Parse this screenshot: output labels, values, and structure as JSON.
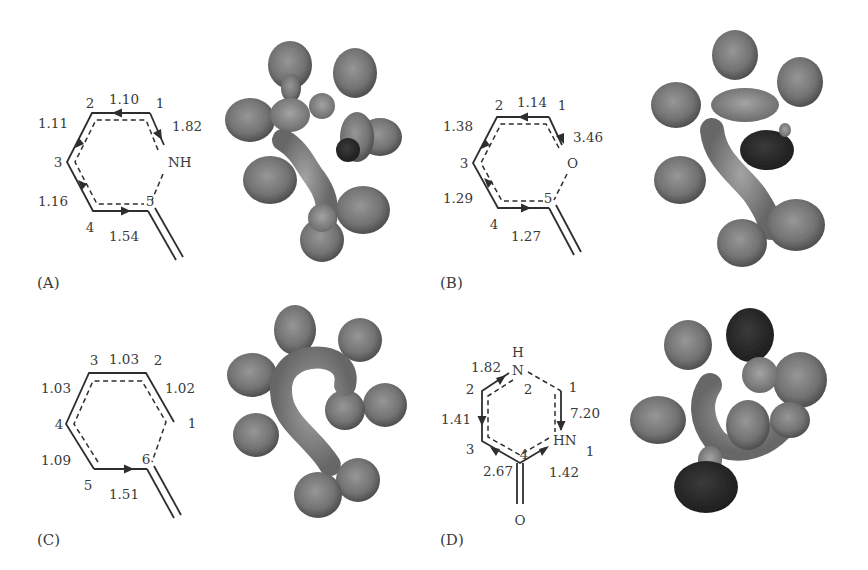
{
  "figure": {
    "panels": [
      {
        "id": "A",
        "label": "(A)",
        "heteroatom": "NH",
        "atoms": [
          "1",
          "2",
          "3",
          "4",
          "5"
        ],
        "bond_values": {
          "b_1_2": "1.10",
          "b_2_3": "1.11",
          "b_3_4": "1.16",
          "b_4_5": "1.54",
          "b_1_N": "1.82"
        },
        "orbital_dark_lobes": 1
      },
      {
        "id": "B",
        "label": "(B)",
        "heteroatom": "O",
        "atoms": [
          "1",
          "2",
          "3",
          "4",
          "5"
        ],
        "bond_values": {
          "b_1_2": "1.14",
          "b_2_3": "1.38",
          "b_3_4": "1.29",
          "b_4_5": "1.27",
          "b_1_O": "3.46"
        },
        "orbital_dark_lobes": 1
      },
      {
        "id": "C",
        "label": "(C)",
        "heteroatom": "",
        "atoms": [
          "1",
          "2",
          "3",
          "4",
          "5",
          "6"
        ],
        "bond_values": {
          "b_3_2": "1.03",
          "b_3_4": "1.03",
          "b_2_1": "1.02",
          "b_4_5": "1.09",
          "b_5_6": "1.51"
        },
        "orbital_dark_lobes": 0
      },
      {
        "id": "D",
        "label": "(D)",
        "heteroatoms": [
          "H",
          "N",
          "HN",
          "O"
        ],
        "atoms": [
          "1",
          "2",
          "3",
          "4",
          "2",
          "1"
        ],
        "bond_values": {
          "b_2_N": "1.82",
          "b_2_3": "1.41",
          "b_3_4": "2.67",
          "b_4_HN": "1.42",
          "b_1_HN": "7.20"
        },
        "orbital_dark_lobes": 2
      }
    ],
    "colors": {
      "line": "#2e2e2e",
      "text": "#3a3a3a",
      "lobe_gray": "#6e6e6e",
      "lobe_light": "#9a9a9a",
      "lobe_dark": "#2a2a2a",
      "background": "#ffffff"
    }
  }
}
